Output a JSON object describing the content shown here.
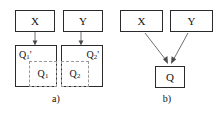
{
  "figure": {
    "type": "diagram",
    "panels": [
      {
        "id": "a",
        "caption": "a)",
        "nodes": [
          {
            "id": "a-x",
            "label": "X",
            "shape": "rectangle"
          },
          {
            "id": "a-y",
            "label": "Y",
            "shape": "rectangle"
          },
          {
            "id": "a-q1",
            "shape": "square",
            "outer_label": "Q",
            "outer_sub": "1",
            "outer_prime": "'",
            "inner_label": "Q",
            "inner_sub": "1",
            "inner_position": "bottom-right",
            "inner_style": "dashed"
          },
          {
            "id": "a-q2",
            "shape": "square",
            "outer_label": "Q",
            "outer_sub": "2",
            "outer_prime": "'",
            "inner_label": "Q",
            "inner_sub": "2",
            "inner_position": "bottom-left",
            "inner_style": "dashed"
          }
        ],
        "edges": [
          {
            "from": "a-x",
            "to": "a-q1",
            "style": "vertical-arrow"
          },
          {
            "from": "a-y",
            "to": "a-q2",
            "style": "vertical-arrow"
          }
        ]
      },
      {
        "id": "b",
        "caption": "b)",
        "nodes": [
          {
            "id": "b-x",
            "label": "X",
            "shape": "rectangle"
          },
          {
            "id": "b-y",
            "label": "Y",
            "shape": "rectangle"
          },
          {
            "id": "b-q",
            "label": "Q",
            "shape": "rectangle"
          }
        ],
        "edges": [
          {
            "from": "b-x",
            "to": "b-q",
            "style": "diagonal-arrow"
          },
          {
            "from": "b-y",
            "to": "b-q",
            "style": "diagonal-arrow"
          }
        ]
      }
    ]
  },
  "colors": {
    "background": "#ffffff",
    "node_border": "#2b2b2b",
    "dashed_border": "#9a9a9a",
    "edge": "#6f6f6f",
    "text": "#111111"
  }
}
